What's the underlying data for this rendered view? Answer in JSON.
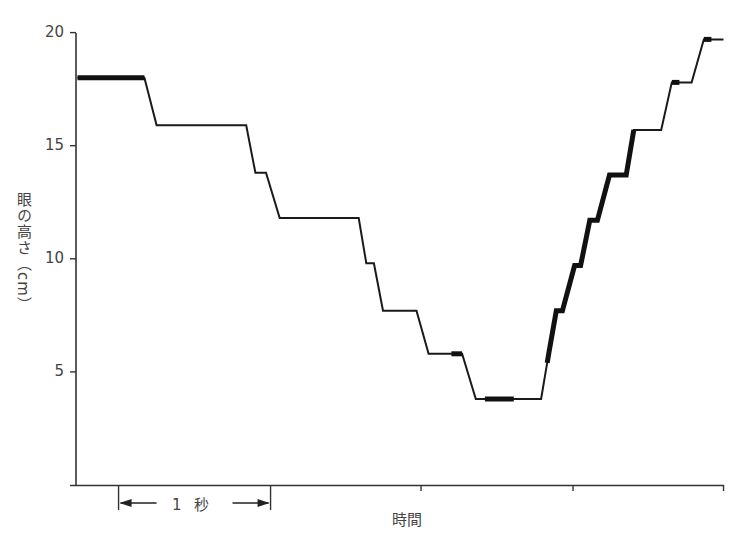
{
  "chart_data": {
    "type": "line",
    "title": "",
    "xlabel": "時間",
    "ylabel": "眼の高さ（cm）",
    "ylim": [
      0,
      20
    ],
    "yticks": [
      5,
      10,
      15,
      20
    ],
    "ytick_labels": [
      "5",
      "10",
      "15",
      "20"
    ],
    "xlim_seconds": [
      0,
      4.26
    ],
    "xticks_seconds": [
      0.28,
      1.28,
      2.27,
      3.27,
      4.26
    ],
    "scale_bar": {
      "label": "1 秒",
      "from_seconds": 0.28,
      "to_seconds": 1.28
    },
    "grid": false,
    "legend": null,
    "series": [
      {
        "name": "eye height",
        "x_seconds": [
          0.01,
          0.45,
          0.53,
          1.12,
          1.18,
          1.25,
          1.34,
          1.86,
          1.91,
          1.96,
          2.02,
          2.24,
          2.32,
          2.54,
          2.63,
          3.06,
          3.11,
          3.16,
          3.2,
          3.28,
          3.32,
          3.38,
          3.43,
          3.51,
          3.62,
          3.67,
          3.85,
          3.92,
          4.05,
          4.13,
          4.26
        ],
        "y_cm": [
          18.0,
          18.0,
          15.9,
          15.9,
          13.8,
          13.8,
          11.8,
          11.8,
          9.8,
          9.8,
          7.7,
          7.7,
          5.8,
          5.8,
          3.8,
          3.8,
          5.8,
          7.7,
          7.7,
          9.7,
          9.7,
          11.7,
          11.7,
          13.7,
          13.7,
          15.7,
          15.7,
          17.8,
          17.8,
          19.7,
          19.7
        ]
      }
    ],
    "thick_segments_seconds": [
      [
        0.01,
        0.45
      ],
      [
        2.47,
        2.54
      ],
      [
        2.69,
        2.88
      ],
      [
        3.1,
        3.67
      ],
      [
        3.92,
        3.97
      ],
      [
        4.13,
        4.18
      ]
    ]
  }
}
